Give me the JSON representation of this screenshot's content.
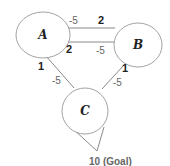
{
  "diagram": {
    "type": "state-graph",
    "nodes": [
      {
        "id": "A",
        "label": "A"
      },
      {
        "id": "B",
        "label": "B"
      },
      {
        "id": "C",
        "label": "C"
      }
    ],
    "edges": [
      {
        "from": "B",
        "to": "A",
        "label_near_from": "2",
        "label_near_to": "-5"
      },
      {
        "from": "A",
        "to": "B",
        "label_near_from": "2",
        "label_near_to": "-5"
      },
      {
        "from": "A",
        "to": "C",
        "label_near_from": "1",
        "label_near_to": "-5"
      },
      {
        "from": "B",
        "to": "C",
        "label_near_from": "1",
        "label_near_to": "-5"
      },
      {
        "from": "C",
        "to": "goal",
        "label": "10 (Goal)"
      }
    ],
    "labels": {
      "ab_top_neg": "-5",
      "ab_top_pos": "2",
      "ab_bottom_pos": "2",
      "ab_bottom_neg": "-5",
      "ac_pos": "1",
      "ac_neg": "-5",
      "bc_pos": "1",
      "bc_neg": "-5",
      "goal": "10 (Goal)"
    },
    "colors": {
      "stroke": "#8a8a8a",
      "node_text": "#222222",
      "weight_text": "#666666"
    }
  }
}
